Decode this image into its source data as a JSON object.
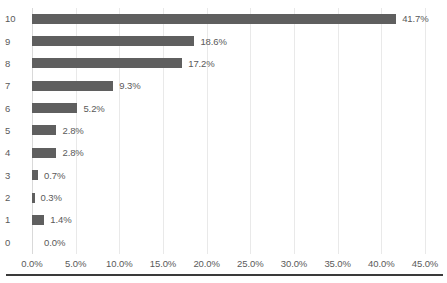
{
  "chart_data": {
    "type": "bar",
    "orientation": "horizontal",
    "title": "",
    "subtitle": "",
    "xlabel": "",
    "ylabel": "",
    "categories": [
      "10",
      "9",
      "8",
      "7",
      "6",
      "5",
      "4",
      "3",
      "2",
      "1",
      "0"
    ],
    "values": [
      41.7,
      18.6,
      17.2,
      9.3,
      5.2,
      2.8,
      2.8,
      0.7,
      0.3,
      1.4,
      0.0
    ],
    "data_labels": [
      "41.7%",
      "18.6%",
      "17.2%",
      "9.3%",
      "5.2%",
      "2.8%",
      "2.8%",
      "0.7%",
      "0.3%",
      "1.4%",
      "0.0%"
    ],
    "xlim": [
      0,
      45
    ],
    "xtick_values": [
      0,
      5,
      10,
      15,
      20,
      25,
      30,
      35,
      40,
      45
    ],
    "xtick_labels": [
      "0.0%",
      "5.0%",
      "10.0%",
      "15.0%",
      "20.0%",
      "25.0%",
      "30.0%",
      "35.0%",
      "40.0%",
      "45.0%"
    ],
    "grid": true,
    "grid_axis": "x",
    "legend": false,
    "legend_position": "none",
    "series": [
      {
        "name": "",
        "values": [
          41.7,
          18.6,
          17.2,
          9.3,
          5.2,
          2.8,
          2.8,
          0.7,
          0.3,
          1.4,
          0.0
        ]
      }
    ]
  },
  "colors": {
    "bar": "#5f5f5f",
    "gridline": "#e9e9e9",
    "axis_line": "#d9d9d9",
    "text": "#5a5a5a",
    "bottom_rule": "#3a3a3a",
    "background": "#ffffff"
  }
}
